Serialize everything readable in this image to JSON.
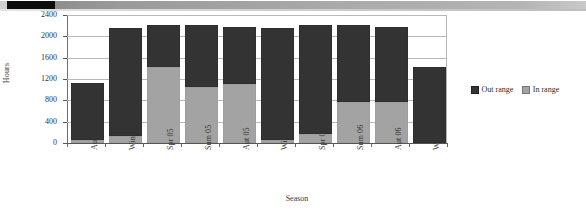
{
  "scan_strip": {
    "name": "scanned-page-edge-artifact",
    "black_segment_color": "#0d0d0d",
    "gray_color": "#a9a9a9"
  },
  "chart_data": {
    "type": "bar",
    "subtype": "stacked",
    "title": "",
    "xlabel": "Season",
    "ylabel": "Hours",
    "categories": [
      "Aut 04",
      "Win 04",
      "Spr 05",
      "Sum 05",
      "Aut 05",
      "Win 05",
      "Spr 06",
      "Sum 06",
      "Aut 06",
      "Win 06"
    ],
    "series": [
      {
        "name": "In range",
        "color": "#a3a3a3",
        "values": [
          60,
          130,
          1420,
          1050,
          1110,
          50,
          160,
          770,
          770,
          0
        ]
      },
      {
        "name": "Out range",
        "color": "#333333",
        "values": [
          1060,
          2020,
          790,
          1160,
          1070,
          2100,
          2050,
          1435,
          1410,
          1430
        ]
      }
    ],
    "totals": [
      1120,
      2150,
      2210,
      2210,
      2180,
      2150,
      2210,
      2205,
      2180,
      1430
    ],
    "ylim": [
      0,
      2400
    ],
    "yticks": [
      0,
      400,
      800,
      1200,
      1600,
      2000,
      2400
    ],
    "ytick_labels": [
      "0",
      "400",
      "800",
      "1200",
      "1600",
      "2000",
      "2400"
    ],
    "grid": true,
    "legend_position": "right",
    "legend_entries": [
      "Out range",
      "In range"
    ],
    "stack_order_bottom_to_top": [
      "In range",
      "Out range"
    ]
  },
  "axes": {
    "y_title": "Hours",
    "x_title": "Season"
  },
  "legend": {
    "items": [
      {
        "label": "Out range",
        "swatch": "out-range-swatch",
        "color": "#333333"
      },
      {
        "label": "In range",
        "swatch": "in-range-swatch",
        "color": "#a3a3a3"
      }
    ]
  }
}
